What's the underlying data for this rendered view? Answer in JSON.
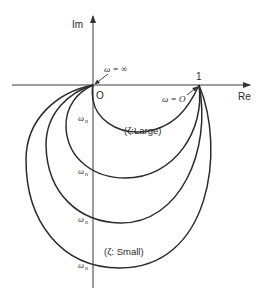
{
  "figure": {
    "type": "Nyquist plot of second-order system for varying damping ratio",
    "axes": {
      "imaginary_label": "Im",
      "real_label": "Re",
      "origin_label": "O",
      "unit_label": "1"
    },
    "annotations": {
      "omega_infinity": "ω = ∞",
      "omega_zero": "ω = O",
      "zeta_large": "(ζ:Large)",
      "zeta_small": "(ζ: Small)",
      "omega_n": "ωn"
    },
    "curves": [
      {
        "name": "zeta-largest",
        "crossing_label": "ωn"
      },
      {
        "name": "zeta-large",
        "crossing_label": "ωn"
      },
      {
        "name": "zeta-small",
        "crossing_label": "ωn"
      },
      {
        "name": "zeta-smallest",
        "crossing_label": "ωn"
      }
    ],
    "colors": {
      "stroke": "#2b2b2b",
      "background": "#ffffff"
    }
  }
}
